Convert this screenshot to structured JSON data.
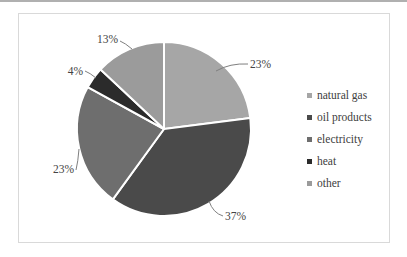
{
  "chart_data": {
    "type": "pie",
    "categories": [
      "natural gas",
      "oil products",
      "electricity",
      "heat",
      "other"
    ],
    "values": [
      23,
      37,
      23,
      4,
      13
    ],
    "labels": [
      "23%",
      "37%",
      "23%",
      "4%",
      "13%"
    ],
    "colors": [
      "#a6a6a6",
      "#4a4a4a",
      "#6e6e6e",
      "#2b2b2b",
      "#9b9b9b"
    ],
    "legend_position": "right",
    "label_color": "#444444",
    "leader_line_color": "#7f7f7f",
    "slice_border_color": "#ffffff"
  }
}
